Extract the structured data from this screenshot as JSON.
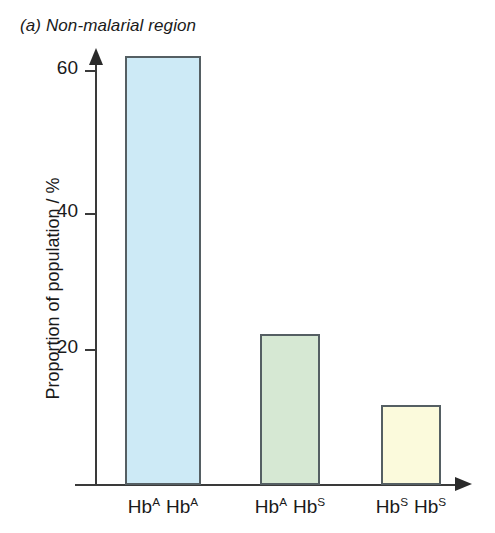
{
  "chart_data": {
    "type": "bar",
    "title": "(a) Non-malarial region",
    "xlabel": "",
    "ylabel": "Proportion of population / %",
    "categories": [
      "Hb^A Hb^A",
      "Hb^A Hb^S",
      "Hb^S Hb^S"
    ],
    "category_parts": [
      {
        "base1": "Hb",
        "sup1": "A",
        "base2": "Hb",
        "sup2": "A"
      },
      {
        "base1": "Hb",
        "sup1": "A",
        "base2": "Hb",
        "sup2": "S"
      },
      {
        "base1": "Hb",
        "sup1": "S",
        "base2": "Hb",
        "sup2": "S"
      }
    ],
    "values": [
      62,
      21.8,
      11.6
    ],
    "ylim": [
      0,
      64
    ],
    "yticks": [
      20,
      40,
      60
    ],
    "ytick_labels": [
      "20",
      "40",
      "60"
    ],
    "grid": false,
    "legend": "none",
    "bar_colors": [
      "#cdeaf6",
      "#d6e8d3",
      "#fbfadc"
    ],
    "bar_border_color": "#555f63",
    "axis_color": "#3a3a3a"
  },
  "figure": {
    "panel_label": "(a)",
    "panel_title": "Non-malarial region"
  }
}
